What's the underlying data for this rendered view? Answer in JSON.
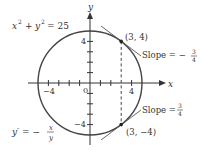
{
  "diagram": {
    "equation": {
      "lhs_x": "x",
      "lhs_y": "y",
      "exp": "2",
      "plus": "+",
      "eq": "= 25"
    },
    "derivative": {
      "lhs": "y′ = −",
      "num": "x",
      "den": "y"
    },
    "axes": {
      "x_label": "x",
      "y_label": "y",
      "origin_label": "0",
      "tick_labels": {
        "x_neg": "−4",
        "x_pos": "4",
        "y_pos": "4",
        "y_neg": "−4"
      }
    },
    "points": [
      {
        "label": "(3, 4)",
        "slope_text": "Slope = −",
        "slope_num": "3",
        "slope_den": "4"
      },
      {
        "label": "(3, −4)",
        "slope_text": "Slope =",
        "slope_num": "3",
        "slope_den": "4"
      }
    ],
    "colors": {
      "curve": "#444444",
      "axis": "#333333",
      "text": "#333333"
    }
  }
}
